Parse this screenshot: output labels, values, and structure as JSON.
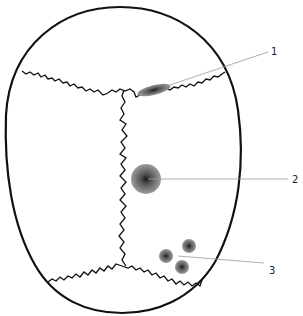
{
  "diagram": {
    "labels": [
      {
        "id": "1",
        "text": "1",
        "x": 273,
        "y": 56,
        "target": "lesion-elongated"
      },
      {
        "id": "2",
        "text": "2",
        "x": 294,
        "y": 183,
        "target": "lesion-large-round"
      },
      {
        "id": "3",
        "text": "3",
        "x": 271,
        "y": 244,
        "target": "lesion-cluster"
      }
    ],
    "colors": {
      "outline": "#111111",
      "leader": "#9a9a9a",
      "lesion": "#555555",
      "background": "#ffffff"
    }
  }
}
